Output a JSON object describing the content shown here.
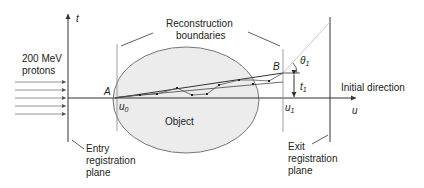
{
  "diagram": {
    "axes": {
      "vertical_label": "t",
      "horizontal_label": "u"
    },
    "labels": {
      "beam": [
        "200 MeV",
        "protons"
      ],
      "reconstruction": [
        "Reconstruction",
        "boundaries"
      ],
      "object": "Object",
      "initial_direction": "Initial direction",
      "entry_plane": [
        "Entry",
        "registration",
        "plane"
      ],
      "exit_plane": [
        "Exit",
        "registration",
        "plane"
      ],
      "point_a": "A",
      "point_b": "B",
      "u0": "u",
      "u0_sub": "0",
      "u1": "u",
      "u1_sub": "1",
      "t1": "t",
      "t1_sub": "1",
      "theta1": "θ",
      "theta1_sub": "1"
    },
    "proton_arrows_count": 5,
    "colors": {
      "line": "#333333",
      "object_fill": "#ececec",
      "object_stroke": "#777777",
      "initial_direction_line": "#bbbbbb"
    }
  }
}
